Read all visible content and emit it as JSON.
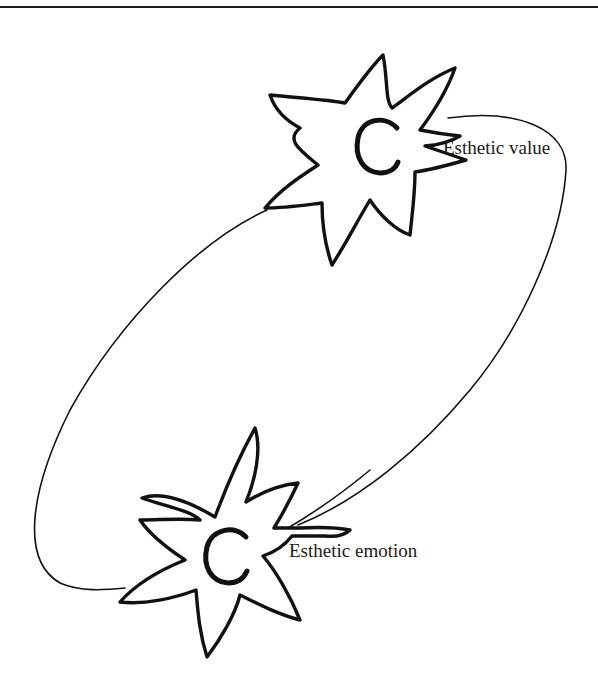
{
  "diagram": {
    "nodes": [
      {
        "id": "esthetic-value",
        "label": "Esthetic value",
        "glyph": "C",
        "shape": "star"
      },
      {
        "id": "esthetic-emotion",
        "label": "Esthetic emotion",
        "glyph": "C",
        "shape": "star"
      }
    ],
    "edges": [
      {
        "from": "esthetic-value",
        "to": "esthetic-emotion",
        "style": "curved loop (clockwise, right side)"
      },
      {
        "from": "esthetic-emotion",
        "to": "esthetic-value",
        "style": "curved loop (left side)"
      }
    ],
    "colors": {
      "stroke": "#111111",
      "background": "#ffffff"
    }
  }
}
